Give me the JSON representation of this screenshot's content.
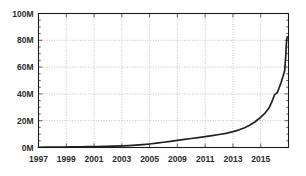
{
  "chart_data": {
    "type": "line",
    "title": "",
    "subtitle": "",
    "xlabel": "",
    "ylabel": "",
    "xlim": [
      1997,
      2015
    ],
    "ylim": [
      0,
      100
    ],
    "grid": true,
    "legend": null,
    "y_tick_labels": [
      "0M",
      "20M",
      "40M",
      "60M",
      "80M",
      "100M"
    ],
    "y_tick_values": [
      0,
      20,
      40,
      60,
      80,
      100
    ],
    "x_tick_labels": [
      "1997",
      "1999",
      "2001",
      "2003",
      "2005",
      "2009",
      "2011",
      "2013",
      "2015"
    ],
    "x_tick_values": [
      1997,
      1999,
      2001,
      2003,
      2005,
      2007,
      2009,
      2011,
      2013,
      2015
    ],
    "units": "millions",
    "series": [
      {
        "name": "total",
        "color": "#222222",
        "x": [
          1997.0,
          1997.6,
          1998.2,
          1998.8,
          1999.4,
          2000.0,
          2000.6,
          2001.2,
          2001.8,
          2002.4,
          2003.0,
          2003.5,
          2004.0,
          2004.5,
          2005.0,
          2005.5,
          2006.0,
          2006.5,
          2007.0,
          2007.5,
          2008.0,
          2008.5,
          2009.0,
          2009.5,
          2010.0,
          2010.5,
          2011.0,
          2011.4,
          2011.8,
          2012.2,
          2012.6,
          2013.0,
          2013.3,
          2013.6,
          2013.8,
          2014.0,
          2014.2,
          2014.45,
          2014.6,
          2014.72,
          2014.8,
          2014.85,
          2014.9
        ],
        "y": [
          0.2,
          0.25,
          0.3,
          0.35,
          0.4,
          0.5,
          0.6,
          0.7,
          0.85,
          1.0,
          1.2,
          1.4,
          1.7,
          2.1,
          2.6,
          3.2,
          3.9,
          4.6,
          5.3,
          6.0,
          6.7,
          7.4,
          8.1,
          8.9,
          9.7,
          10.6,
          11.8,
          13.0,
          14.6,
          16.6,
          19.2,
          22.6,
          25.5,
          29.5,
          34.0,
          39.5,
          41.0,
          48.0,
          53.0,
          57.0,
          68.0,
          78.0,
          82.5
        ]
      }
    ]
  },
  "figure": {
    "background_color": "#ffffff",
    "plot_background_color": "#ffffff",
    "frame_color": "#1a1a1a",
    "grid_color": "#b4b4b4",
    "tick_color": "#555555",
    "label_color": "#2b2b2b"
  }
}
